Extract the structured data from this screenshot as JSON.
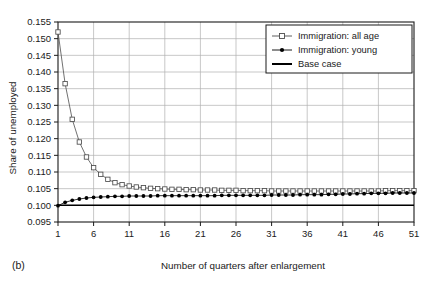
{
  "panel": {
    "label": "(b)"
  },
  "chart_data": {
    "type": "line",
    "title": "",
    "subtitle": "",
    "xlabel": "Number of quarters after enlargement",
    "ylabel": "Share of unemployed",
    "xlim": [
      1,
      51
    ],
    "ylim": [
      0.095,
      0.155
    ],
    "xticks": [
      1,
      6,
      11,
      16,
      21,
      26,
      31,
      36,
      41,
      46,
      51
    ],
    "xtick_labels": [
      "1",
      "6",
      "11",
      "16",
      "21",
      "26",
      "31",
      "36",
      "41",
      "46",
      "51"
    ],
    "yticks": [
      0.095,
      0.1,
      0.105,
      0.11,
      0.115,
      0.12,
      0.125,
      0.13,
      0.135,
      0.14,
      0.145,
      0.15,
      0.155
    ],
    "ytick_labels": [
      "0.095",
      "0.100",
      "0.105",
      "0.110",
      "0.115",
      "0.120",
      "0.125",
      "0.130",
      "0.135",
      "0.140",
      "0.145",
      "0.150",
      "0.155"
    ],
    "grid": true,
    "grid_x": true,
    "grid_y": true,
    "legend_position": "top-right",
    "x": [
      1,
      2,
      3,
      4,
      5,
      6,
      7,
      8,
      9,
      10,
      11,
      12,
      13,
      14,
      15,
      16,
      17,
      18,
      19,
      20,
      21,
      22,
      23,
      24,
      25,
      26,
      27,
      28,
      29,
      30,
      31,
      32,
      33,
      34,
      35,
      36,
      37,
      38,
      39,
      40,
      41,
      42,
      43,
      44,
      45,
      46,
      47,
      48,
      49,
      50,
      51
    ],
    "series": [
      {
        "name": "Immigration: all age",
        "marker": "open-square",
        "values": [
          0.152,
          0.1365,
          0.1258,
          0.119,
          0.1145,
          0.1113,
          0.1093,
          0.1078,
          0.1068,
          0.1062,
          0.1058,
          0.1055,
          0.1053,
          0.1051,
          0.105,
          0.1049,
          0.1048,
          0.1048,
          0.1047,
          0.1047,
          0.1046,
          0.1046,
          0.1046,
          0.1045,
          0.1045,
          0.1045,
          0.1044,
          0.1044,
          0.1044,
          0.1044,
          0.1043,
          0.1043,
          0.1043,
          0.1043,
          0.1043,
          0.1043,
          0.1043,
          0.1043,
          0.1043,
          0.1043,
          0.1043,
          0.1043,
          0.1043,
          0.1043,
          0.1043,
          0.1043,
          0.1044,
          0.1044,
          0.1044,
          0.1044,
          0.1044
        ]
      },
      {
        "name": "Immigration: young",
        "marker": "filled-circle",
        "values": [
          0.0999,
          0.1009,
          0.1015,
          0.1019,
          0.1022,
          0.1024,
          0.1025,
          0.1026,
          0.1027,
          0.1027,
          0.1028,
          0.1028,
          0.1028,
          0.1028,
          0.1029,
          0.1029,
          0.1029,
          0.1029,
          0.1029,
          0.1029,
          0.1029,
          0.1029,
          0.1029,
          0.103,
          0.103,
          0.103,
          0.103,
          0.103,
          0.103,
          0.103,
          0.1031,
          0.1031,
          0.1031,
          0.1031,
          0.1032,
          0.1032,
          0.1032,
          0.1032,
          0.1033,
          0.1033,
          0.1034,
          0.1034,
          0.1035,
          0.1035,
          0.1036,
          0.1036,
          0.1036,
          0.1037,
          0.1037,
          0.1037,
          0.1037
        ]
      },
      {
        "name": "Base case",
        "marker": "none",
        "values": [
          0.1,
          0.1,
          0.1,
          0.1,
          0.1,
          0.1,
          0.1,
          0.1,
          0.1,
          0.1,
          0.1,
          0.1,
          0.1,
          0.1,
          0.1,
          0.1,
          0.1,
          0.1,
          0.1,
          0.1,
          0.1,
          0.1,
          0.1,
          0.1,
          0.1,
          0.1,
          0.1,
          0.1,
          0.1,
          0.1,
          0.1,
          0.1,
          0.1,
          0.1,
          0.1,
          0.1,
          0.1,
          0.1,
          0.1,
          0.1,
          0.1,
          0.1,
          0.1,
          0.1,
          0.1,
          0.1,
          0.1,
          0.1,
          0.1,
          0.1,
          0.1
        ]
      }
    ],
    "colors": {
      "axis": "#1a1a1a",
      "grid": "#b0b0b0",
      "series_all_age": "#4d4d4d",
      "series_young": "#000000",
      "base_case": "#000000",
      "background": "#ffffff"
    }
  }
}
